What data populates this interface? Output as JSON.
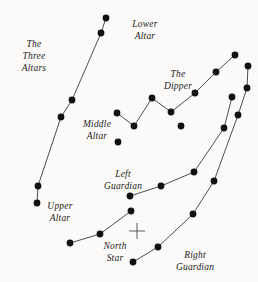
{
  "figure": {
    "kind": "star-chart-diagram",
    "width": 258,
    "height": 282,
    "background_color": "#fbfaf8",
    "star_color": "#111111",
    "line_color": "#3a3a3a",
    "label_color": "#1b1b1b"
  },
  "labels": [
    {
      "id": "three-altars",
      "text": "The\nThree\nAltars",
      "x": 34,
      "y": 38
    },
    {
      "id": "lower-altar",
      "text": "Lower\nAltar",
      "x": 145,
      "y": 18
    },
    {
      "id": "the-dipper",
      "text": "The\nDipper",
      "x": 178,
      "y": 68
    },
    {
      "id": "middle-altar",
      "text": "Middle\nAltar",
      "x": 97,
      "y": 118
    },
    {
      "id": "left-guardian",
      "text": "Left\nGuardian",
      "x": 123,
      "y": 168
    },
    {
      "id": "upper-altar",
      "text": "Upper\nAltar",
      "x": 60,
      "y": 200
    },
    {
      "id": "north-star",
      "text": "North\nStar",
      "x": 115,
      "y": 240
    },
    {
      "id": "right-guardian",
      "text": "Right\nGuardian",
      "x": 195,
      "y": 249
    }
  ],
  "constellations": [
    {
      "name": "The Three Altars",
      "stars": [
        {
          "name": "lower-altar-top",
          "x": 106,
          "y": 18
        },
        {
          "name": "lower-altar-lower",
          "x": 101,
          "y": 33
        },
        {
          "name": "middle-altar-upper",
          "x": 72,
          "y": 100
        },
        {
          "name": "middle-altar-lower",
          "x": 61,
          "y": 117
        },
        {
          "name": "upper-altar-upper",
          "x": 38,
          "y": 186
        },
        {
          "name": "upper-altar-lower",
          "x": 37,
          "y": 203
        }
      ],
      "segments": [
        [
          0,
          1
        ],
        [
          1,
          2
        ],
        [
          2,
          3
        ],
        [
          3,
          4
        ],
        [
          4,
          5
        ]
      ]
    },
    {
      "name": "The Dipper",
      "stars": [
        {
          "name": "dipper-handle-end",
          "x": 117,
          "y": 113
        },
        {
          "name": "dipper-bowl-bottom",
          "x": 134,
          "y": 126
        },
        {
          "name": "dipper-bowl-top",
          "x": 152,
          "y": 98
        },
        {
          "name": "dipper-join",
          "x": 171,
          "y": 112
        },
        {
          "name": "dipper-arc-1",
          "x": 195,
          "y": 93
        },
        {
          "name": "dipper-arc-2",
          "x": 216,
          "y": 72
        },
        {
          "name": "dipper-arc-3",
          "x": 235,
          "y": 55
        }
      ],
      "segments": [
        [
          0,
          1
        ],
        [
          1,
          2
        ],
        [
          2,
          3
        ],
        [
          3,
          4
        ],
        [
          4,
          5
        ],
        [
          5,
          6
        ]
      ]
    },
    {
      "name": "Left Guardian",
      "stars": [
        {
          "name": "left-guardian-spur",
          "x": 118,
          "y": 142
        },
        {
          "name": "left-guardian-base",
          "x": 130,
          "y": 196
        },
        {
          "name": "left-guardian-mid",
          "x": 161,
          "y": 186
        },
        {
          "name": "left-guardian-bend",
          "x": 194,
          "y": 172
        },
        {
          "name": "left-guardian-upper",
          "x": 224,
          "y": 128
        },
        {
          "name": "left-guardian-top",
          "x": 232,
          "y": 97
        }
      ],
      "segments": [
        [
          1,
          2
        ],
        [
          2,
          3
        ],
        [
          3,
          4
        ],
        [
          4,
          5
        ]
      ]
    },
    {
      "name": "North Star",
      "stars": [
        {
          "name": "north-star-west",
          "x": 70,
          "y": 243
        },
        {
          "name": "north-star-mid",
          "x": 100,
          "y": 234
        },
        {
          "name": "north-star-east",
          "x": 131,
          "y": 211
        }
      ],
      "segments": [
        [
          0,
          1
        ],
        [
          1,
          2
        ]
      ]
    },
    {
      "name": "Right Guardian",
      "stars": [
        {
          "name": "right-guardian-base",
          "x": 133,
          "y": 262
        },
        {
          "name": "right-guardian-low",
          "x": 158,
          "y": 247
        },
        {
          "name": "right-guardian-mid",
          "x": 193,
          "y": 214
        },
        {
          "name": "right-guardian-bend",
          "x": 214,
          "y": 181
        },
        {
          "name": "right-guardian-upper",
          "x": 238,
          "y": 115
        },
        {
          "name": "right-guardian-top",
          "x": 247,
          "y": 88
        },
        {
          "name": "right-guardian-crown",
          "x": 248,
          "y": 66
        }
      ],
      "segments": [
        [
          0,
          1
        ],
        [
          1,
          2
        ],
        [
          2,
          3
        ],
        [
          3,
          4
        ],
        [
          4,
          5
        ],
        [
          5,
          6
        ]
      ]
    },
    {
      "name": "Dipper Spur",
      "stars": [
        {
          "name": "dipper-spur-star",
          "x": 181,
          "y": 126
        }
      ],
      "segments": []
    }
  ],
  "markers": [
    {
      "name": "celestial-pole-cross",
      "x": 137,
      "y": 231,
      "arm": 8
    }
  ]
}
